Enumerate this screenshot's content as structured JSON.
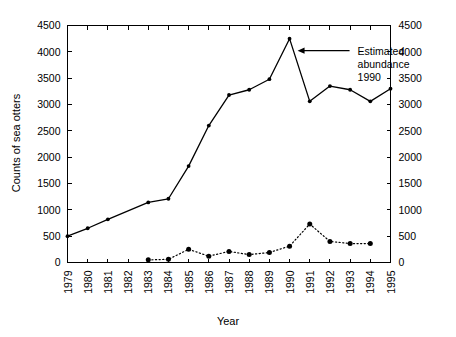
{
  "chart_data": {
    "type": "line",
    "title": "",
    "xlabel": "Year",
    "ylabel": "Counts of sea otters",
    "ylabel_right": "",
    "x": [
      1979,
      1980,
      1981,
      1982,
      1983,
      1984,
      1985,
      1986,
      1987,
      1988,
      1989,
      1990,
      1991,
      1992,
      1993,
      1994,
      1995
    ],
    "xtick_labels": [
      "1979",
      "1980",
      "1981",
      "1982",
      "1983",
      "1984",
      "1985",
      "1986",
      "1987",
      "1988",
      "1989",
      "1990",
      "1991",
      "1992",
      "1993",
      "1994",
      "1995"
    ],
    "ytick_labels": [
      "0",
      "500",
      "1000",
      "1500",
      "2000",
      "2500",
      "3000",
      "3500",
      "4000",
      "4500"
    ],
    "ytick_values": [
      0,
      500,
      1000,
      1500,
      2000,
      2500,
      3000,
      3500,
      4000,
      4500
    ],
    "ytick_labels_right": [
      "0",
      "500",
      "1000",
      "1500",
      "2000",
      "2500",
      "3000",
      "3500",
      "4000",
      "4500"
    ],
    "ylim": [
      0,
      4500
    ],
    "xlim": [
      1979,
      1995
    ],
    "grid": false,
    "legend": "none",
    "series": [
      {
        "name": "counts-of-sea-otters",
        "style": "solid",
        "marker": "filled-circle",
        "x": [
          1979,
          1980,
          1981,
          1983,
          1984,
          1985,
          1986,
          1987,
          1988,
          1989,
          1990,
          1991,
          1992,
          1993,
          1994,
          1995
        ],
        "values": [
          500,
          650,
          820,
          1140,
          1210,
          1830,
          2600,
          3180,
          3280,
          3480,
          4250,
          3060,
          3350,
          3280,
          3060,
          3300
        ]
      },
      {
        "name": "secondary-counts",
        "style": "dotted",
        "marker": "filled-circle",
        "x": [
          1983,
          1984,
          1985,
          1986,
          1987,
          1988,
          1989,
          1990,
          1991,
          1992,
          1993,
          1994
        ],
        "values": [
          50,
          60,
          250,
          120,
          210,
          150,
          190,
          310,
          730,
          400,
          360,
          360
        ]
      }
    ],
    "annotations": [
      {
        "name": "estimated-abundance-1990",
        "lines": [
          "Estimated",
          "abundance",
          "1990"
        ],
        "target_x": 1990,
        "target_y": 4250,
        "arrow": true
      }
    ]
  },
  "axes": {
    "y_left_title": "Counts of sea otters",
    "x_title": "Year"
  }
}
